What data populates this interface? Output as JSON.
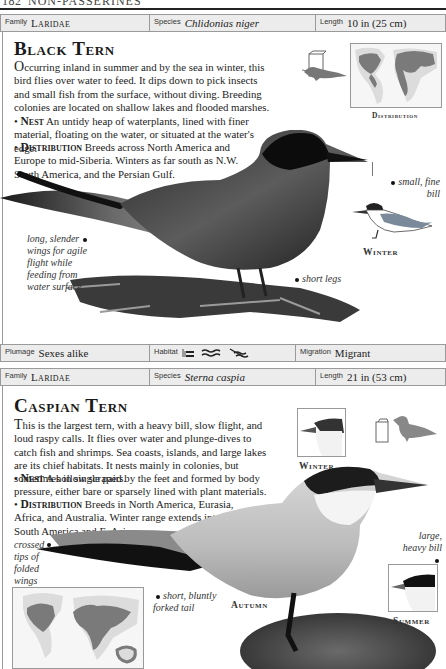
{
  "page": {
    "number": "182",
    "section": "NON-PASSERINES"
  },
  "entries": [
    {
      "info_top": {
        "family_label": "Family",
        "family": "Laridae",
        "species_label": "Species",
        "species": "Chlidonias niger",
        "length_label": "Length",
        "length": "10 in (25 cm)"
      },
      "title": "Black Tern",
      "description": {
        "lead": "O",
        "text": "ccurring inland in summer and by the sea in winter, this bird flies over water to feed. It dips down to pick insects and small fish from the surface, without diving. Breeding colonies are located on shallow lakes and flooded marshes.",
        "nest_label": "Nest",
        "nest": "An untidy heap of waterplants, lined with finer material, floating on the water, or situated at the water's edge.",
        "distribution_label": "Distribution",
        "distribution": "Breeds across North America and Europe to mid-Siberia. Winters as far south as N.W. South America, and the Persian Gulf."
      },
      "map_caption": "Distribution",
      "callouts": {
        "bill": "small, fine bill",
        "wings": "long, slender wings for agile flight while feeding from water surface",
        "legs": "short legs"
      },
      "inset_caption": "Winter",
      "info_bottom": {
        "plumage_label": "Plumage",
        "plumage": "Sexes alike",
        "habitat_label": "Habitat",
        "habitat_icons": [
          "marsh-icon",
          "open-water-icon",
          "coast-icon"
        ],
        "migration_label": "Migration",
        "migration": "Migrant"
      }
    },
    {
      "info_top": {
        "family_label": "Family",
        "family": "Laridae",
        "species_label": "Species",
        "species": "Sterna caspia",
        "length_label": "Length",
        "length": "21 in (53 cm)"
      },
      "title": "Caspian Tern",
      "description": {
        "lead": "T",
        "text": "his is the largest tern, with a heavy bill, slow flight, and loud raspy calls. It flies over water and plunge-dives to catch fish and shrimps. Sea coasts, islands, and large lakes are its chief habitats. It nests mainly in colonies, but sometimes in single pairs.",
        "nest_label": "Nest",
        "nest": "A hollow scraped by the feet and formed by body pressure, either bare or sparsely lined with plant materials.",
        "distribution_label": "Distribution",
        "distribution": "Breeds in North America, Eurasia, Africa, and Australia. Winter range extends into N. South America and E. Asia."
      },
      "callouts": {
        "wings": "crossed tips of folded wings",
        "tail": "short, bluntly forked tail",
        "bill": "large, heavy bill"
      },
      "captions": {
        "winter": "Winter",
        "autumn": "Autumn",
        "summer": "Summer"
      }
    }
  ],
  "colors": {
    "info_bar_bg": "#ececec",
    "border": "#9a9a9a",
    "map_range": "#7a7a7a",
    "map_land": "#dcdcdc"
  }
}
